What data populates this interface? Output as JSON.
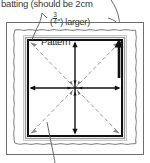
{
  "diagram": {
    "caption": {
      "line1": "batting (should be 2cm",
      "line2_prefix": "(",
      "fraction_numerator": "3",
      "fraction_denominator": "4",
      "line2_suffix": "\") larger)"
    },
    "labels": {
      "pattern": "Pattern"
    },
    "colors": {
      "ink": "#3a3a3a",
      "frame_dark": "#111111",
      "frame_mid": "#8d8d8d",
      "frame_light": "#c9c9c9",
      "background": "#ffffff",
      "dashed": "#9a9a9a"
    },
    "geometry": {
      "outer_border": {
        "x": 6,
        "y": 22,
        "width": 138,
        "height": 133
      },
      "batting_wavy_inset": 8,
      "pattern_frame": {
        "x": 26,
        "y": 38,
        "width": 98,
        "height": 100
      },
      "center": {
        "x": 75,
        "y": 88
      }
    },
    "arrows": {
      "cardinal": [
        "up",
        "down",
        "left",
        "right"
      ],
      "diagonal": [
        "up-left",
        "up-right",
        "down-left",
        "down-right"
      ],
      "edge_arrow_right": "up"
    },
    "leaders": [
      {
        "name": "batting-leader-top-left",
        "from": "caption",
        "to": "batting-edge"
      },
      {
        "name": "batting-leader-top-right",
        "from": "caption",
        "to": "outer-border"
      },
      {
        "name": "pattern-leader-bottom",
        "from": "pattern-frame",
        "to": "below"
      }
    ]
  }
}
